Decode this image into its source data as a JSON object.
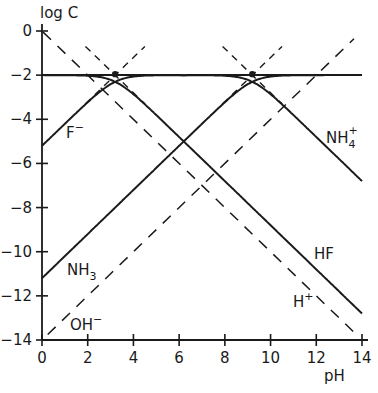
{
  "chart_data": {
    "type": "line",
    "title": "",
    "xlabel": "pH",
    "ylabel": "log C",
    "xlim": [
      0,
      14
    ],
    "ylim": [
      -14,
      0
    ],
    "grid": false,
    "legend": "inline labels on curves",
    "x_ticks": [
      0,
      2,
      4,
      6,
      8,
      10,
      12,
      14
    ],
    "x_tick_labels": [
      "0",
      "2",
      "4",
      "6",
      "8",
      "10",
      "12",
      "14"
    ],
    "y_ticks": [
      0,
      -2,
      -4,
      -6,
      -8,
      -10,
      -12,
      -14
    ],
    "y_tick_labels": [
      "0",
      "-2",
      "-4",
      "-6",
      "-8",
      "-10",
      "-12",
      "-14"
    ],
    "parameters": {
      "total_log_concentration": -2,
      "pKa_HF": 3.2,
      "pKa_NH4": 9.2,
      "pKw": 14
    },
    "series": [
      {
        "name": "HF",
        "style": "solid",
        "x": [
          0,
          2,
          3.2,
          4,
          6,
          8,
          10,
          12,
          14
        ],
        "values": [
          -2.0,
          -2.03,
          -2.3,
          -2.86,
          -4.8,
          -6.8,
          -8.8,
          -10.8,
          -12.8
        ]
      },
      {
        "name": "F⁻",
        "style": "solid",
        "x": [
          0,
          2,
          3.2,
          4,
          6,
          8,
          10,
          12,
          14
        ],
        "values": [
          -5.2,
          -3.23,
          -2.3,
          -2.07,
          -2.0,
          -2.0,
          -2.0,
          -2.0,
          -2.0
        ]
      },
      {
        "name": "NH₄⁺",
        "style": "solid",
        "x": [
          0,
          2,
          4,
          6,
          8,
          9.2,
          10,
          12,
          14
        ],
        "values": [
          -2.0,
          -2.0,
          -2.0,
          -2.0,
          -2.03,
          -2.3,
          -2.86,
          -4.8,
          -6.8
        ]
      },
      {
        "name": "NH₃",
        "style": "solid",
        "x": [
          0,
          2,
          4,
          6,
          8,
          9.2,
          10,
          12,
          14
        ],
        "values": [
          -11.2,
          -9.2,
          -7.2,
          -5.2,
          -3.23,
          -2.3,
          -2.07,
          -2.0,
          -2.0
        ]
      },
      {
        "name": "H⁺",
        "style": "dashed",
        "x": [
          0,
          14
        ],
        "values": [
          0,
          -14
        ]
      },
      {
        "name": "OH⁻",
        "style": "dashed",
        "x": [
          0,
          14
        ],
        "values": [
          -14,
          0
        ]
      }
    ],
    "system_points": [
      {
        "label": "pKa HF",
        "x": 3.2,
        "y": -2
      },
      {
        "label": "pKa NH₄⁺",
        "x": 9.2,
        "y": -2
      }
    ],
    "annotations": [
      {
        "text": "F⁻",
        "x": 1.2,
        "y": -4.6
      },
      {
        "text": "NH₄⁺",
        "x": 12.6,
        "y": -4.7
      },
      {
        "text": "HF",
        "x": 12.2,
        "y": -10.1
      },
      {
        "text": "NH₃",
        "x": 1.2,
        "y": -10.6
      },
      {
        "text": "H⁺",
        "x": 11.2,
        "y": -12.2
      },
      {
        "text": "OH⁻",
        "x": 1.3,
        "y": -13.3
      }
    ]
  },
  "labels": {
    "y_axis_title": "log C",
    "x_axis_title": "pH",
    "F": {
      "base": "F",
      "sup": "−"
    },
    "NH4": {
      "base": "NH",
      "sub": "4",
      "sup": "+"
    },
    "HF": {
      "base": "HF"
    },
    "NH3": {
      "base": "NH",
      "sub": "3"
    },
    "H": {
      "base": "H",
      "sup": "+"
    },
    "OH": {
      "base": "OH",
      "sup": "−"
    }
  },
  "colors": {
    "line": "#1a1a1a",
    "background": "#ffffff"
  }
}
